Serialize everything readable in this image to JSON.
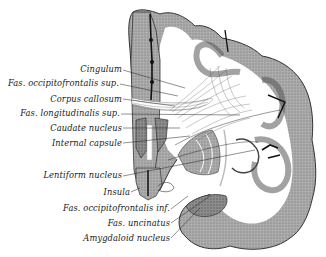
{
  "figure": {
    "labels": [
      {
        "id": "cingulum",
        "text": "Cingulum",
        "right": 122,
        "top": 64
      },
      {
        "id": "fas-occ-sup",
        "text": "Fas. occipitofrontalis sup.",
        "right": 119,
        "top": 78
      },
      {
        "id": "corpus-callosum",
        "text": "Corpus callosum",
        "right": 122,
        "top": 94
      },
      {
        "id": "fas-long-sup",
        "text": "Fas. longitudinalis sup.",
        "right": 120,
        "top": 108
      },
      {
        "id": "caudate",
        "text": "Caudate nucleus",
        "right": 122,
        "top": 123
      },
      {
        "id": "internal-capsule",
        "text": "Internal capsule",
        "right": 122,
        "top": 138
      },
      {
        "id": "lentiform",
        "text": "Lentiform nucleus",
        "right": 122,
        "top": 170
      },
      {
        "id": "insula",
        "text": "Insula",
        "right": 130,
        "top": 187
      },
      {
        "id": "fas-occ-inf",
        "text": "Fas. occipitofrontalis inf.",
        "right": 170,
        "top": 203
      },
      {
        "id": "fas-uncinatus",
        "text": "Fas. uncinatus",
        "right": 170,
        "top": 218
      },
      {
        "id": "amygdaloid",
        "text": "Amygdaloid nucleus",
        "right": 170,
        "top": 233
      }
    ]
  }
}
